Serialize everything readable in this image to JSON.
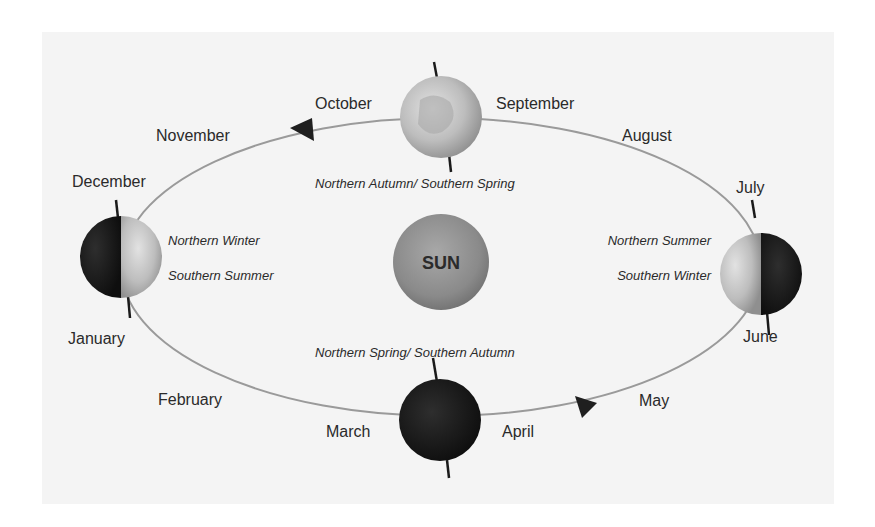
{
  "diagram": {
    "center": {
      "label": "SUN"
    },
    "months": {
      "january": "January",
      "february": "February",
      "march": "March",
      "april": "April",
      "may": "May",
      "june": "June",
      "july": "July",
      "august": "August",
      "september": "September",
      "october": "October",
      "november": "November",
      "december": "December"
    },
    "seasons": {
      "top": "Northern Autumn/ Southern Spring",
      "bottom": "Northern Spring/ Southern Autumn",
      "left_line1": "Northern Winter",
      "left_line2": "Southern Summer",
      "right_line1": "Northern Summer",
      "right_line2": "Southern Winter"
    },
    "earth_positions": [
      {
        "position": "top",
        "shading": "lit-full",
        "months_near": [
          "October",
          "September"
        ]
      },
      {
        "position": "left",
        "shading": "left-half-dark",
        "months_near": [
          "December",
          "January"
        ]
      },
      {
        "position": "right",
        "shading": "right-half-dark",
        "months_near": [
          "July",
          "June"
        ]
      },
      {
        "position": "bottom",
        "shading": "dark-full",
        "months_near": [
          "March",
          "April"
        ]
      }
    ],
    "orbit_direction_arrows": [
      "top-left (near November, pointing left)",
      "bottom-right (near May, pointing right)"
    ],
    "colors": {
      "background": "#f4f4f4",
      "orbit_line": "#9a9a9a",
      "earth_dark": "#1c1c1c",
      "earth_lit": "#c9c9c9",
      "sun": "#8a8a8a",
      "text": "#2a2a2a"
    }
  }
}
